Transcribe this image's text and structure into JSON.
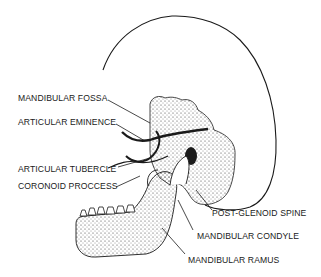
{
  "diagram": {
    "colors": {
      "ink": "#1a1a1a",
      "background": "#ffffff",
      "stipple": "#333333"
    },
    "labels": [
      {
        "id": "mandibular-fossa",
        "text": "MANDIBULAR FOSSA"
      },
      {
        "id": "articular-eminence",
        "text": "ARTICULAR EMINENCE"
      },
      {
        "id": "articular-tubercle",
        "text": "ARTICULAR TUBERCLE"
      },
      {
        "id": "coronoid-process",
        "text": "CORONOID PROCCESS"
      },
      {
        "id": "post-glenoid-spine",
        "text": "POST-GLENOID SPINE"
      },
      {
        "id": "mandibular-condyle",
        "text": "MANDIBULAR CONDYLE"
      },
      {
        "id": "mandibular-ramus",
        "text": "MANDIBULAR RAMUS"
      }
    ]
  }
}
